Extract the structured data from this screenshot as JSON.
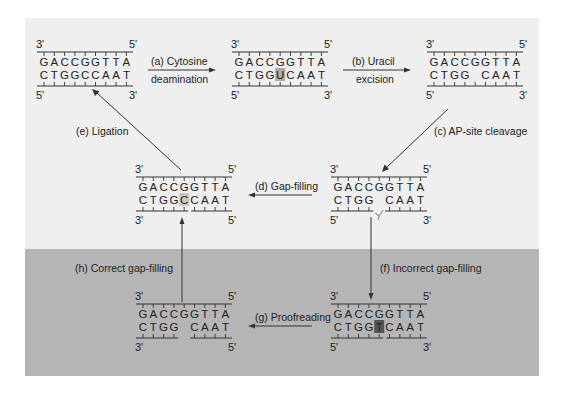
{
  "panel": {
    "light_color": "#efefef",
    "dark_color": "#b5b5b5"
  },
  "blocks": [
    {
      "id": "a",
      "name": "original-dna",
      "top_strand": "GACCGGTTA",
      "bottom_strand": "CTGGCCAAT",
      "ends": {
        "top_left": "3'",
        "top_right": "5'",
        "bottom_left": "5'",
        "bottom_right": "3'"
      },
      "gap_index": null,
      "highlight_index": null
    },
    {
      "id": "b",
      "name": "deaminated-dna",
      "top_strand": "GACCGGTTA",
      "bottom_strand": "CTGGUCAAT",
      "ends": {
        "top_left": "3'",
        "top_right": "5'",
        "bottom_left": "5'",
        "bottom_right": "3'"
      },
      "gap_index": null,
      "highlight_index": 4,
      "highlight_style": "light"
    },
    {
      "id": "c",
      "name": "ap-site-dna",
      "top_strand": "GACCGGTTA",
      "bottom_strand": "CTGG CAAT",
      "ends": {
        "top_left": "3'",
        "top_right": "5'",
        "bottom_left": "5'",
        "bottom_right": "3'"
      },
      "gap_index": null,
      "highlight_index": null
    },
    {
      "id": "d",
      "name": "gap-filled-dna",
      "top_strand": "GACCGGTTA",
      "bottom_strand": "CTGGCCAAT",
      "ends": {
        "top_left": "3'",
        "top_right": "5'",
        "bottom_left": "3'",
        "bottom_right": "5'"
      },
      "gap_index": 4,
      "highlight_index": 4,
      "highlight_style": "mid"
    },
    {
      "id": "e",
      "name": "cleaved-dna",
      "top_strand": "GACCGGTTA",
      "bottom_strand": "CTGG CAAT",
      "ends": {
        "top_left": "3'",
        "top_right": "5'",
        "bottom_left": "5'",
        "bottom_right": "3'"
      },
      "gap_index": 4,
      "highlight_index": null
    },
    {
      "id": "f",
      "name": "mismatch-dna",
      "top_strand": "GACCGGTTA",
      "bottom_strand": "CTGGTCAAT",
      "ends": {
        "top_left": "3'",
        "top_right": "5'",
        "bottom_left": "5'",
        "bottom_right": "3'"
      },
      "gap_index": 4,
      "highlight_index": 4,
      "highlight_style": "dark"
    },
    {
      "id": "g",
      "name": "proofread-dna",
      "top_strand": "GACCGGTTA",
      "bottom_strand": "CTGG CAAT",
      "ends": {
        "top_left": "3'",
        "top_right": "5'",
        "bottom_left": "3'",
        "bottom_right": "5'"
      },
      "gap_index": 4,
      "highlight_index": null
    }
  ],
  "steps": {
    "a": {
      "line1": "(a) Cytosine",
      "line2": "deamination"
    },
    "b": {
      "line1": "(b) Uracil",
      "line2": "excision"
    },
    "c": {
      "label": "(c) AP-site cleavage"
    },
    "d": {
      "label": "(d) Gap-filling"
    },
    "e": {
      "label": "(e) Ligation"
    },
    "f": {
      "label": "(f) Incorrect gap-filling"
    },
    "g": {
      "label": "(g) Proofreading"
    },
    "h": {
      "label": "(h) Correct gap-filling"
    }
  }
}
